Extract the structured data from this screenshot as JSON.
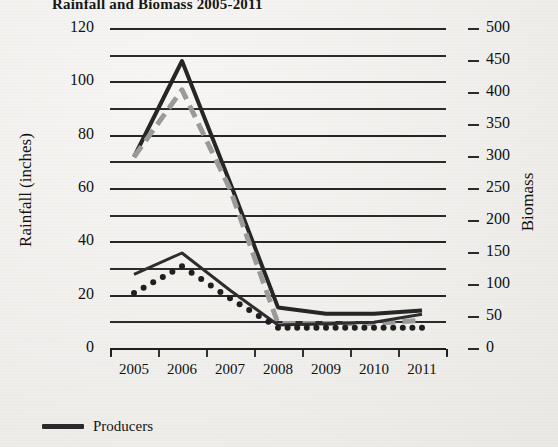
{
  "chart_data": {
    "type": "line",
    "title": "Rainfall and Biomass 2005-2011",
    "xlabel": "",
    "ylabel": "Rainfall (inches)",
    "ylabel_right": "Biomass",
    "categories": [
      "2005",
      "2006",
      "2007",
      "2008",
      "2009",
      "2010",
      "2011"
    ],
    "x": [
      2005,
      2006,
      2007,
      2008,
      2009,
      2010,
      2011
    ],
    "ylim": [
      0,
      120
    ],
    "yticks": [
      0,
      20,
      40,
      60,
      80,
      100,
      120
    ],
    "ytick_labels": [
      "0",
      "20",
      "40",
      "60",
      "80",
      "100",
      "120"
    ],
    "gridline_step": 10,
    "ylim_right": [
      0,
      500
    ],
    "yticks_right": [
      0,
      50,
      100,
      150,
      200,
      250,
      300,
      350,
      400,
      450,
      500
    ],
    "ytick_labels_right": [
      "0",
      "50",
      "100",
      "150",
      "200",
      "250",
      "300",
      "350",
      "400",
      "450",
      "500"
    ],
    "grid": true,
    "legend_position": "bottom-left",
    "series": [
      {
        "name": "Producers",
        "axis": "right",
        "style": "solid",
        "color": "#262626",
        "width": 4,
        "values": [
          300,
          450,
          260,
          65,
          55,
          55,
          60
        ]
      },
      {
        "name": "Rainfall",
        "axis": "right",
        "style": "dashed",
        "color": "#9a9a9a",
        "width": 5,
        "values": [
          300,
          405,
          250,
          40,
          40,
          40,
          45
        ]
      },
      {
        "name": "Consumers",
        "axis": "left",
        "style": "solid",
        "color": "#2d2d2d",
        "width": 3,
        "values": [
          28,
          36,
          22,
          9,
          9.5,
          10,
          13
        ]
      },
      {
        "name": "Decomposers",
        "axis": "left",
        "style": "dotted",
        "color": "#1f1f1f",
        "width": 3,
        "values": [
          21,
          31,
          19,
          8,
          8,
          8,
          8
        ]
      }
    ],
    "legend_entries": [
      {
        "label": "Producers",
        "style": "solid",
        "color": "#2a2a2a"
      }
    ]
  }
}
